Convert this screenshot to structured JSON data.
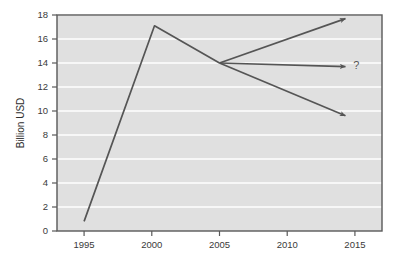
{
  "chart_data": {
    "type": "line",
    "title": "",
    "xlabel": "",
    "ylabel": "Billion USD",
    "xlim": [
      1993.0,
      2017.0
    ],
    "ylim": [
      0,
      18
    ],
    "grid": true,
    "legend": null,
    "xticks": [
      "1995",
      "2000",
      "2005",
      "2010",
      "2015"
    ],
    "xtick_values": [
      1995,
      2000,
      2005,
      2010,
      2015
    ],
    "yticks": [
      "0",
      "2",
      "4",
      "6",
      "8",
      "10",
      "12",
      "14",
      "16",
      "18"
    ],
    "ytick_values": [
      0,
      2,
      4,
      6,
      8,
      10,
      12,
      14,
      16,
      18
    ],
    "series": [
      {
        "name": "historical",
        "x": [
          1995.0,
          2000.2,
          2005.0
        ],
        "values": [
          0.8,
          17.1,
          14.0
        ]
      },
      {
        "name": "forecast-up",
        "x": [
          2005.0,
          2014.3
        ],
        "values": [
          14.0,
          17.7
        ],
        "arrow": true
      },
      {
        "name": "forecast-flat",
        "x": [
          2005.0,
          2014.3
        ],
        "values": [
          14.0,
          13.7
        ],
        "arrow": true
      },
      {
        "name": "forecast-down",
        "x": [
          2005.0,
          2014.3
        ],
        "values": [
          14.0,
          9.6
        ],
        "arrow": true
      }
    ],
    "annotations": [
      {
        "text": "?",
        "x": 2015.1,
        "y": 13.8
      }
    ],
    "colors": {
      "plot_background": "#e0e0e0",
      "gridline": "#ffffff",
      "line": "#555555",
      "border": "#595959",
      "text": "#3a3a3a",
      "page_background": "#ffffff"
    }
  }
}
